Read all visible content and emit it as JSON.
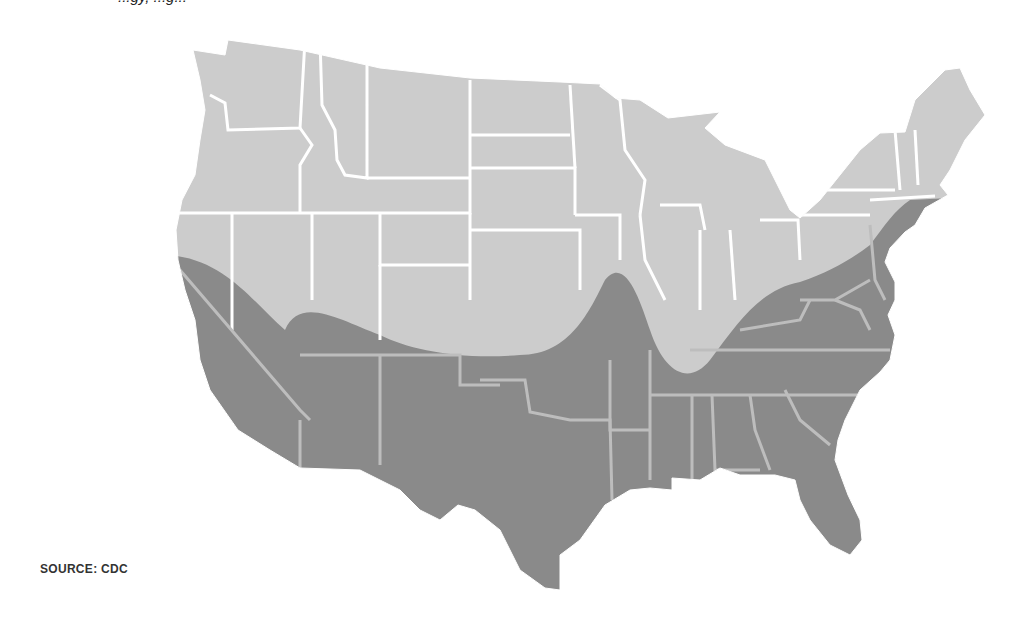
{
  "caption": {
    "partial_top_text": "...gy, ...g..."
  },
  "map": {
    "title": "Map of the contiguous United States with shaded southern region",
    "region": "Contiguous United States",
    "legend": [],
    "colors": {
      "base_states": "#cccccc",
      "shaded_region": "#8a8a8a",
      "state_borders_base": "#ffffff",
      "state_borders_shaded": "#bdbdbd",
      "background": "#ffffff"
    },
    "shaded_area_description": "Dark band covering southern states: CA (south/central), AZ, NM, TX, OK (south), AR, LA, MS, AL, GA, FL, SC, NC, TN, KY, VA, WV, MD, DE, NJ and coastal east up to CT/RI"
  },
  "source": {
    "label": "SOURCE: CDC"
  }
}
